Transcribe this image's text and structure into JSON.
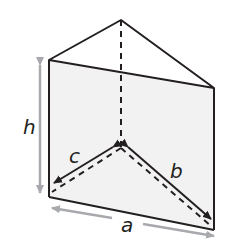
{
  "diagram": {
    "type": "triangular-prism",
    "labels": {
      "height": "h",
      "base_edge": "a",
      "side_b": "b",
      "side_c": "c"
    },
    "colors": {
      "edge": "#231f20",
      "face_fill": "#f2f2f2",
      "dimension_arrow": "#a7a9ac",
      "background": "#ffffff"
    }
  }
}
